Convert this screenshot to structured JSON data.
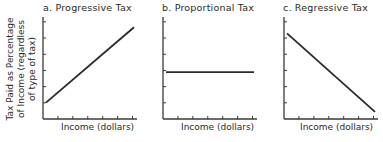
{
  "figure": {
    "ylabel_lines": [
      "Tax Paid as Percentage",
      "of Income (regardless",
      "of type of tax)"
    ],
    "panels": [
      {
        "title": "a. Progressive Tax",
        "xlabel": "Income (dollars)"
      },
      {
        "title": "b. Proportional Tax",
        "xlabel": "Income (dollars)"
      },
      {
        "title": "c. Regressive Tax",
        "xlabel": "Income (dollars)"
      }
    ]
  },
  "chart_data": [
    {
      "type": "line",
      "title": "a. Progressive Tax",
      "xlabel": "Income (dollars)",
      "ylabel": "Tax Paid as Percentage of Income (regardless of type of tax)",
      "x": [
        0,
        100
      ],
      "series": [
        {
          "name": "Progressive Tax",
          "values": [
            16,
            90
          ]
        }
      ],
      "ylim": [
        0,
        100
      ],
      "xlim": [
        0,
        100
      ],
      "x_ticks": 6,
      "y_ticks": 6,
      "grid": false,
      "tick_labels": false
    },
    {
      "type": "line",
      "title": "b. Proportional Tax",
      "xlabel": "Income (dollars)",
      "ylabel": "Tax Paid as Percentage of Income (regardless of type of tax)",
      "x": [
        0,
        100
      ],
      "series": [
        {
          "name": "Proportional Tax",
          "values": [
            46,
            46
          ]
        }
      ],
      "ylim": [
        0,
        100
      ],
      "xlim": [
        0,
        100
      ],
      "x_ticks": 6,
      "y_ticks": 6,
      "grid": false,
      "tick_labels": false
    },
    {
      "type": "line",
      "title": "c. Regressive Tax",
      "xlabel": "Income (dollars)",
      "ylabel": "Tax Paid as Percentage of Income (regardless of type of tax)",
      "x": [
        0,
        100
      ],
      "series": [
        {
          "name": "Regressive Tax",
          "values": [
            84,
            7
          ]
        }
      ],
      "ylim": [
        0,
        100
      ],
      "xlim": [
        0,
        100
      ],
      "x_ticks": 6,
      "y_ticks": 6,
      "grid": false,
      "tick_labels": false
    }
  ],
  "colors": {
    "line": "#2a2a2a",
    "axis": "#3a3a3a",
    "background": "#ffffff"
  }
}
